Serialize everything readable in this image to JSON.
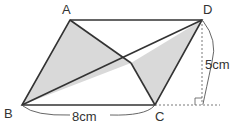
{
  "diagram": {
    "points": {
      "A": {
        "label": "A",
        "x": 70,
        "y": 20
      },
      "D": {
        "label": "D",
        "x": 202,
        "y": 20
      },
      "B": {
        "label": "B",
        "x": 22,
        "y": 105
      },
      "C": {
        "label": "C",
        "x": 155,
        "y": 105
      },
      "P": {
        "x": 131,
        "y": 63
      }
    },
    "labels": {
      "A": "A",
      "B": "B",
      "C": "C",
      "D": "D",
      "base": "8cm",
      "height": "5cm"
    },
    "colors": {
      "stroke": "#333333",
      "fill": "#d9d9d9",
      "text": "#333333"
    }
  }
}
